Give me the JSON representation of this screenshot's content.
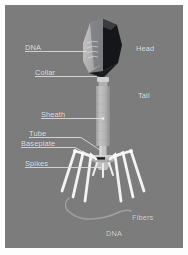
{
  "figure": {
    "kind": "bacteriophage-anatomy-diagram",
    "background_color": "#7c7c7c",
    "border_color": "#ffffff",
    "label_color": "#e8e8e8",
    "leader_color": "#e0e0e0"
  },
  "labels": {
    "dna_top": "DNA",
    "collar": "Collar",
    "sheath": "Sheath",
    "tube": "Tube",
    "baseplate": "Baseplate",
    "spikes": "Spikes",
    "head": "Head",
    "tail": "Tail",
    "fibers": "Fibers",
    "dna_bottom": "DNA"
  },
  "structures": {
    "capsid_light_face": "#b9b9b9",
    "capsid_dark_face": "#15161a",
    "capsid_mid_face": "#6e7076",
    "collar_color": "#c9c9c9",
    "sheath_color": "#b2b2b2",
    "sheath_shadow": "#8f8f8f",
    "tube_color": "#c4c4c4",
    "baseplate_color": "#cfcfcf",
    "fiber_color": "#f2f2f2",
    "spike_color": "#e6e6e6",
    "dna_strand_color": "#9a9a9a"
  }
}
